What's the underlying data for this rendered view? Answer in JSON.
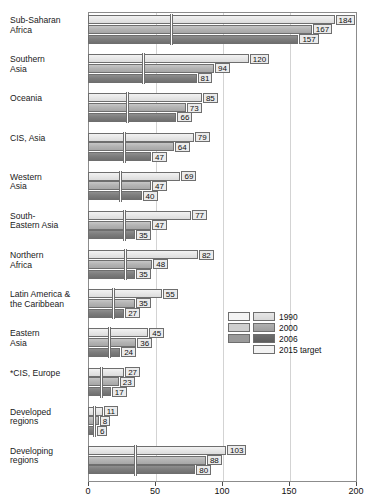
{
  "chart": {
    "title": "",
    "type": "bar"
  },
  "legend": {
    "position": "inside-right",
    "items": [
      {
        "label": "1990"
      },
      {
        "label": "2000"
      },
      {
        "label": "2006"
      },
      {
        "label": "2015 target"
      }
    ]
  },
  "axis": {
    "xlabel": "",
    "ylabel": "",
    "xmin": 0,
    "xmax": 200,
    "ticks": [
      {
        "value": 0,
        "label": "0"
      },
      {
        "value": 50,
        "label": "50"
      },
      {
        "value": 100,
        "label": "100"
      },
      {
        "value": 150,
        "label": "150"
      },
      {
        "value": 200,
        "label": "200"
      }
    ]
  },
  "chart_data": {
    "type": "bar",
    "title": "",
    "xlabel": "",
    "ylabel": "",
    "xlim": [
      0,
      200
    ],
    "grid": true,
    "orientation": "horizontal",
    "legend_position": "inside-right",
    "categories": [
      "Sub-Saharan\nAfrica",
      "Southern\nAsia",
      "Oceania",
      "CIS, Asia",
      "Western\nAsia",
      "South-\nEastern Asia",
      "Northern\nAfrica",
      "Latin America &\nthe Caribbean",
      "Eastern\nAsia",
      "*CIS, Europe",
      "Developed\nregions",
      "Developing\nregions"
    ],
    "series": [
      {
        "name": "1990",
        "values": [
          184,
          120,
          85,
          79,
          69,
          77,
          82,
          55,
          45,
          27,
          11,
          103
        ]
      },
      {
        "name": "2000",
        "values": [
          167,
          94,
          73,
          64,
          47,
          47,
          48,
          35,
          36,
          23,
          8,
          88
        ]
      },
      {
        "name": "2006",
        "values": [
          157,
          81,
          66,
          47,
          40,
          35,
          35,
          27,
          24,
          17,
          6,
          80
        ]
      },
      {
        "name": "2015 target",
        "values": [
          61,
          40,
          28,
          26,
          23,
          26,
          27,
          18,
          15,
          9,
          4,
          34
        ]
      }
    ]
  },
  "groups": [
    {
      "label": "Sub-Saharan\nAfrica",
      "v1990": 184,
      "v2000": 167,
      "v2006": 157,
      "target": 61,
      "l1990": "184",
      "l2000": "167",
      "l2006": "157"
    },
    {
      "label": "Southern\nAsia",
      "v1990": 120,
      "v2000": 94,
      "v2006": 81,
      "target": 40,
      "l1990": "120",
      "l2000": "94",
      "l2006": "81"
    },
    {
      "label": "Oceania",
      "v1990": 85,
      "v2000": 73,
      "v2006": 66,
      "target": 28,
      "l1990": "85",
      "l2000": "73",
      "l2006": "66"
    },
    {
      "label": "CIS, Asia",
      "v1990": 79,
      "v2000": 64,
      "v2006": 47,
      "target": 26,
      "l1990": "79",
      "l2000": "64",
      "l2006": "47"
    },
    {
      "label": "Western\nAsia",
      "v1990": 69,
      "v2000": 47,
      "v2006": 40,
      "target": 23,
      "l1990": "69",
      "l2000": "47",
      "l2006": "40"
    },
    {
      "label": "South-\nEastern Asia",
      "v1990": 77,
      "v2000": 47,
      "v2006": 35,
      "target": 26,
      "l1990": "77",
      "l2000": "47",
      "l2006": "35"
    },
    {
      "label": "Northern\nAfrica",
      "v1990": 82,
      "v2000": 48,
      "v2006": 35,
      "target": 27,
      "l1990": "82",
      "l2000": "48",
      "l2006": "35"
    },
    {
      "label": "Latin America &\nthe Caribbean",
      "v1990": 55,
      "v2000": 35,
      "v2006": 27,
      "target": 18,
      "l1990": "55",
      "l2000": "35",
      "l2006": "27"
    },
    {
      "label": "Eastern\nAsia",
      "v1990": 45,
      "v2000": 36,
      "v2006": 24,
      "target": 15,
      "l1990": "45",
      "l2000": "36",
      "l2006": "24"
    },
    {
      "label": "*CIS, Europe",
      "v1990": 27,
      "v2000": 23,
      "v2006": 17,
      "target": 9,
      "l1990": "27",
      "l2000": "23",
      "l2006": "17"
    },
    {
      "label": "Developed\nregions",
      "v1990": 11,
      "v2000": 8,
      "v2006": 6,
      "target": 4,
      "l1990": "11",
      "l2000": "8",
      "l2006": "6"
    },
    {
      "label": "Developing\nregions",
      "v1990": 103,
      "v2000": 88,
      "v2006": 80,
      "target": 34,
      "l1990": "103",
      "l2000": "88",
      "l2006": "80"
    }
  ]
}
